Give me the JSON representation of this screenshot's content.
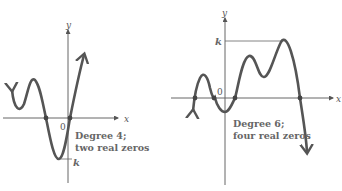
{
  "graphs": [
    {
      "caption_line1": "Degree 4;",
      "caption_line2": "two real zeros",
      "x_label": "x",
      "y_label": "y",
      "origin_label": "0",
      "k_label": "k"
    },
    {
      "caption_line1": "Degree 6;",
      "caption_line2": "four real zeros",
      "x_label": "x",
      "y_label": "y",
      "origin_label": "0",
      "k_label": "k"
    }
  ],
  "colors": {
    "curve": "#555555",
    "axis": "#666666",
    "background": "#ffffff"
  }
}
